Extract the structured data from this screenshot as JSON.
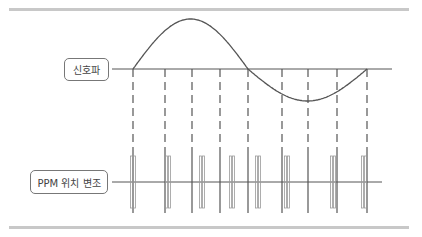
{
  "diagram": {
    "labels": {
      "signal": "신호파",
      "ppm": "PPM 위치 변조"
    },
    "colors": {
      "line": "#555555",
      "pulse": "#9a9a9a",
      "rule": "#c8c8c8"
    },
    "signal_axis_y": 69,
    "ppm_axis_y": 182,
    "axis_x_start": 112,
    "axis_x_end": 392,
    "sine": {
      "x_start": 133,
      "x_end": 367,
      "amplitude_up": 50,
      "amplitude_down": 32,
      "zero_cross_x": 248
    },
    "sample_lines_x": [
      133,
      165,
      192,
      220,
      248,
      282,
      308,
      337,
      367
    ],
    "pulse_pairs_x": [
      133,
      168,
      202,
      232,
      258,
      287,
      333,
      364
    ]
  }
}
